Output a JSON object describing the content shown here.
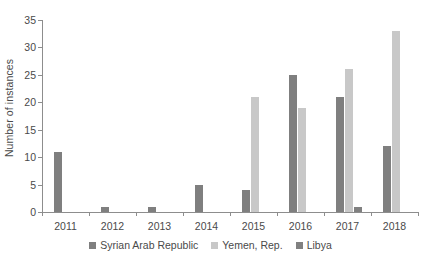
{
  "chart_data": {
    "type": "bar",
    "title": "",
    "subtitle": "",
    "xlabel": "",
    "ylabel": "Number of instances",
    "categories": [
      "2011",
      "2012",
      "2013",
      "2014",
      "2015",
      "2016",
      "2017",
      "2018"
    ],
    "series": [
      {
        "name": "Syrian Arab Republic",
        "color": "#7f7f7f",
        "values": [
          11,
          1,
          1,
          5,
          4,
          25,
          21,
          12
        ]
      },
      {
        "name": "Yemen, Rep.",
        "color": "#c8c8c8",
        "values": [
          0,
          0,
          0,
          0,
          21,
          19,
          26,
          33
        ]
      },
      {
        "name": "Libya",
        "color": "#808080",
        "values": [
          0,
          0,
          0,
          0,
          0,
          0,
          1,
          0
        ]
      }
    ],
    "ylim": [
      0,
      35
    ],
    "yticks": [
      0,
      5,
      10,
      15,
      20,
      25,
      30,
      35
    ],
    "ytick_labels": [
      "0",
      "5",
      "10",
      "15",
      "20",
      "25",
      "30",
      "35"
    ],
    "grid": false,
    "legend_position": "bottom",
    "axis_color": "#8d8d8d",
    "text_color": "#4a4a4a",
    "background": "#ffffff"
  }
}
